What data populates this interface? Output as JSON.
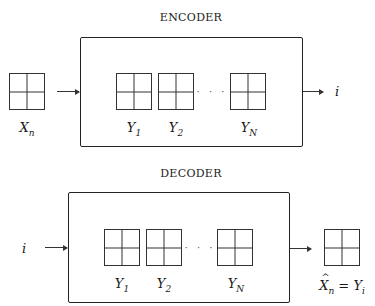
{
  "encoder": {
    "title": "ENCODER",
    "input_label": "X",
    "input_sub": "n",
    "codebook": [
      {
        "label": "Y",
        "sub": "1"
      },
      {
        "label": "Y",
        "sub": "2"
      },
      {
        "label": "Y",
        "sub": "N"
      }
    ],
    "ellipsis": "· · ·",
    "output_label": "i"
  },
  "decoder": {
    "title": "DECODER",
    "input_label": "i",
    "codebook": [
      {
        "label": "Y",
        "sub": "1"
      },
      {
        "label": "Y",
        "sub": "2"
      },
      {
        "label": "Y",
        "sub": "N"
      }
    ],
    "ellipsis": "· · ·",
    "output_label_lhs": "X",
    "output_label_lhs_sub": "n",
    "output_label_eq": " = ",
    "output_label_rhs": "Y",
    "output_label_rhs_sub": "i"
  },
  "colors": {
    "stroke": "#222222",
    "background": "#ffffff"
  }
}
